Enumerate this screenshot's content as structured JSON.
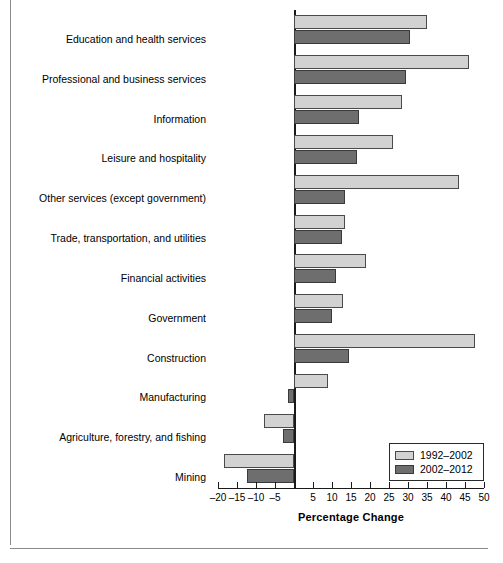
{
  "chart_data": {
    "type": "bar",
    "orientation": "horizontal",
    "title": "",
    "xlabel": "Percentage Change",
    "ylabel": "",
    "xlim": [
      -20,
      50
    ],
    "xticks": [
      -20,
      -15,
      -10,
      -5,
      0,
      5,
      10,
      15,
      20,
      25,
      30,
      35,
      40,
      45,
      50
    ],
    "xtick_labels": [
      "–20",
      "–15",
      "–10",
      "–5",
      "",
      "5",
      "10",
      "15",
      "20",
      "25",
      "30",
      "35",
      "40",
      "45",
      "50"
    ],
    "grid": false,
    "legend_position": "bottom-right",
    "categories": [
      "Education and health services",
      "Professional and business services",
      "Information",
      "Leisure and hospitality",
      "Other services (except government)",
      "Trade, transportation, and utilities",
      "Financial activities",
      "Government",
      "Construction",
      "Manufacturing",
      "Agriculture, forestry, and fishing",
      "Mining"
    ],
    "series": [
      {
        "name": "1992–2002",
        "color": "#d2d2d2",
        "values": [
          35.0,
          46.0,
          28.5,
          26.0,
          43.5,
          13.5,
          19.0,
          13.0,
          47.5,
          9.0,
          -8.0,
          -18.5
        ]
      },
      {
        "name": "2002–2012",
        "color": "#6e6e6e",
        "values": [
          30.5,
          29.5,
          17.0,
          16.5,
          13.5,
          12.5,
          11.0,
          10.0,
          14.5,
          -1.5,
          -3.0,
          -12.5
        ]
      }
    ]
  },
  "axis": {
    "x_title": "Percentage Change"
  },
  "legend": {
    "entries": [
      {
        "label": "1992–2002"
      },
      {
        "label": "2002–2012"
      }
    ]
  }
}
